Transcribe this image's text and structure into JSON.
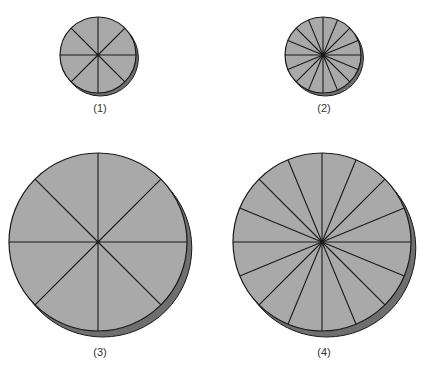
{
  "colors": {
    "face": "#a9a9a9",
    "side": "#6f6f6f",
    "line": "#1a1a1a",
    "background": "#ffffff"
  },
  "disks": [
    {
      "id": 1,
      "label": "(1)",
      "cx": 98,
      "cy": 55,
      "r": 38,
      "slices": 8,
      "depth": 3,
      "label_x": 100,
      "label_y": 102
    },
    {
      "id": 2,
      "label": "(2)",
      "cx": 323,
      "cy": 55,
      "r": 38,
      "slices": 16,
      "depth": 3,
      "label_x": 324,
      "label_y": 102
    },
    {
      "id": 3,
      "label": "(3)",
      "cx": 98,
      "cy": 242,
      "r": 89,
      "slices": 8,
      "depth": 6,
      "label_x": 100,
      "label_y": 346
    },
    {
      "id": 4,
      "label": "(4)",
      "cx": 322,
      "cy": 242,
      "r": 89,
      "slices": 16,
      "depth": 6,
      "label_x": 324,
      "label_y": 346
    }
  ]
}
